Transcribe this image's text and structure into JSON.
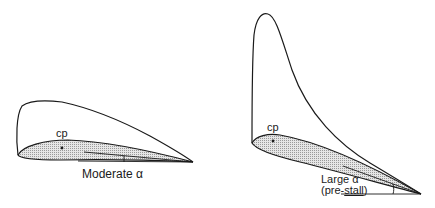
{
  "diagram": {
    "panels": [
      {
        "id": "moderate",
        "cp_label": "cp",
        "alpha_label": "Moderate α"
      },
      {
        "id": "large",
        "cp_label": "cp",
        "alpha_label_line1": "Large α",
        "alpha_label_line2_prefix": "(pre-",
        "alpha_label_line2_underlined": "stall",
        "alpha_label_line2_suffix": ")"
      }
    ],
    "colors": {
      "stroke": "#1a1a1a",
      "fill": "#d9d9d9",
      "background": "#ffffff"
    }
  }
}
